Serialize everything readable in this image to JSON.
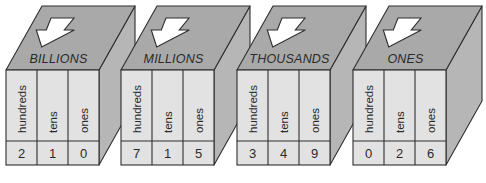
{
  "colors": {
    "top_face": "#a9a9a9",
    "side_face": "#b6b6b6",
    "front_face": "#e2e2e2",
    "outline": "#2e2e2e",
    "arrow": "#ffffff"
  },
  "icons": {
    "period_arrow": "down-arrow-icon"
  },
  "periods": [
    {
      "name": "BILLIONS",
      "columns": [
        {
          "label": "hundreds",
          "digit": "2"
        },
        {
          "label": "tens",
          "digit": "1"
        },
        {
          "label": "ones",
          "digit": "0"
        }
      ]
    },
    {
      "name": "MILLIONS",
      "columns": [
        {
          "label": "hundreds",
          "digit": "7"
        },
        {
          "label": "tens",
          "digit": "1"
        },
        {
          "label": "ones",
          "digit": "5"
        }
      ]
    },
    {
      "name": "THOUSANDS",
      "columns": [
        {
          "label": "hundreds",
          "digit": "3"
        },
        {
          "label": "tens",
          "digit": "4"
        },
        {
          "label": "ones",
          "digit": "9"
        }
      ]
    },
    {
      "name": "ONES",
      "columns": [
        {
          "label": "hundreds",
          "digit": "0"
        },
        {
          "label": "tens",
          "digit": "2"
        },
        {
          "label": "ones",
          "digit": "6"
        }
      ]
    }
  ]
}
